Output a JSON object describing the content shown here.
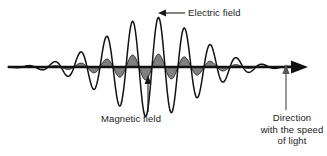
{
  "figure": {
    "labels": {
      "electric_field": "Electric field",
      "magnetic_field": "Magnetic field",
      "direction_line1": "Direction",
      "direction_line2": "with the speed",
      "direction_line3": "of light"
    },
    "colors": {
      "background": "#ffffff",
      "electric_wave_stroke": "#111111",
      "magnetic_wave_fill": "#808080",
      "magnetic_wave_stroke": "#222222",
      "axis": "#111111",
      "pointer_gray": "#808080",
      "text": "#1a1a1a"
    }
  },
  "chart_data": {
    "type": "line",
    "xlabel": "Direction with the speed of light",
    "ylabel": "Field amplitude",
    "grid": false,
    "legend": [
      "Electric field",
      "Magnetic field"
    ],
    "axis": {
      "baseline_y": 67,
      "x_start": 8,
      "x_end": 305,
      "arrowhead": "right"
    },
    "envelope": {
      "type": "gaussian",
      "center_x": 152,
      "sigma": 46
    },
    "series": [
      {
        "name": "Electric field",
        "style": "outline",
        "wavelength_px": 26,
        "peak_amplitude_px": 50,
        "phase": "sine",
        "color": "#111111"
      },
      {
        "name": "Magnetic field",
        "style": "filled",
        "wavelength_px": 26,
        "peak_amplitude_px": 13,
        "phase": "sine",
        "color": "#808080"
      }
    ],
    "annotations": [
      {
        "text": "Electric field",
        "arrow": "left",
        "target_x": 158,
        "target_y": 18,
        "label_x": 188,
        "label_y": 12
      },
      {
        "text": "Magnetic field",
        "arrow": "up",
        "target_x": 148,
        "target_y": 74,
        "label_x": 143,
        "label_y": 118
      },
      {
        "text": "Direction with the speed of light",
        "arrow": "up",
        "target_x": 286,
        "target_y": 63,
        "label_x": 292,
        "label_y": 118
      }
    ]
  }
}
